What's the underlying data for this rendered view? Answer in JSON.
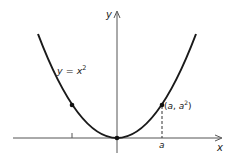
{
  "diagram": {
    "type": "graph-of-function",
    "function_label": {
      "lhs": "y",
      "eq": " = ",
      "var": "x",
      "exp": "2"
    },
    "axes": {
      "x_label": "x",
      "y_label": "y"
    },
    "point_label": {
      "open": "(",
      "a": "a",
      "sep": ", ",
      "a2": "a",
      "exp": "2",
      "close": ")"
    },
    "tick_label_a": "a",
    "colors": {
      "curve": "#1a1a1a",
      "axes": "#555555",
      "points": "#111111"
    }
  }
}
